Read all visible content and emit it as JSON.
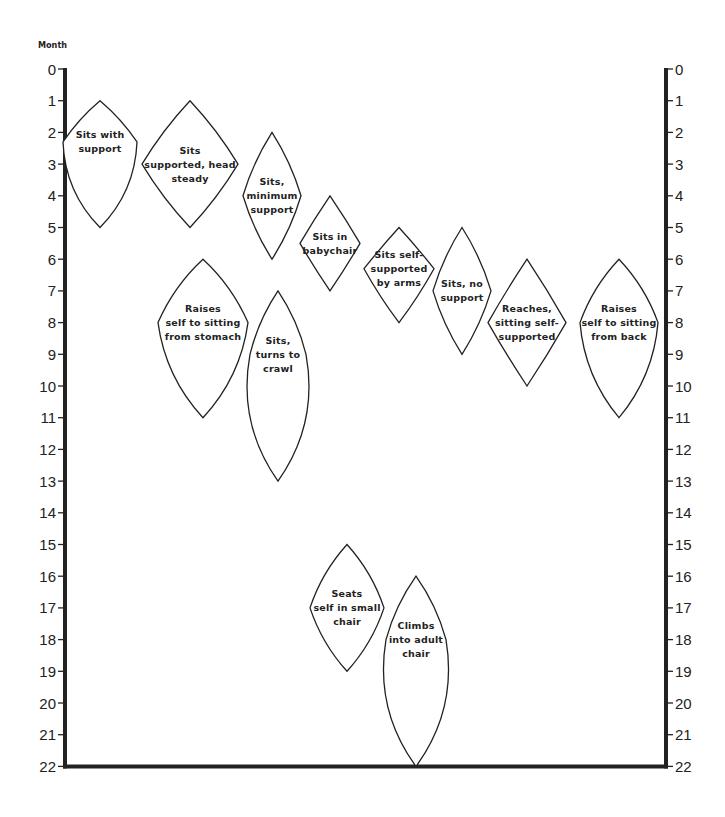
{
  "chart_data": {
    "type": "range-diamond",
    "title": "",
    "ylabel": "Month",
    "ylim": [
      0,
      22
    ],
    "yticks": [
      0,
      1,
      2,
      3,
      4,
      5,
      6,
      7,
      8,
      9,
      10,
      11,
      12,
      13,
      14,
      15,
      16,
      17,
      18,
      19,
      20,
      21,
      22
    ],
    "y_axis_both_sides": true,
    "grid": false,
    "items": [
      {
        "label": [
          "Sits with",
          "support"
        ],
        "start": 1,
        "peak": 2.3,
        "end": 5,
        "cx": 100,
        "hw": 37,
        "top_curve": 0.2,
        "bottom_curve": 0.55
      },
      {
        "label": [
          "Sits",
          "supported, head",
          "steady"
        ],
        "start": 1,
        "peak": 3,
        "end": 5,
        "cx": 190,
        "hw": 48,
        "top_curve": 0.15,
        "bottom_curve": 0.15
      },
      {
        "label": [
          "Sits,",
          "minimum",
          "support"
        ],
        "start": 2,
        "peak": 4,
        "end": 6,
        "cx": 272,
        "hw": 29,
        "top_curve": 0.2,
        "bottom_curve": 0.2
      },
      {
        "label": [
          "Sits in",
          "babychair"
        ],
        "start": 4,
        "peak": 5.5,
        "end": 7,
        "cx": 330,
        "hw": 30,
        "top_curve": 0.05,
        "bottom_curve": 0.05
      },
      {
        "label": [
          "Sits self-",
          "supported",
          "by arms"
        ],
        "start": 5,
        "peak": 6.3,
        "end": 8,
        "cx": 399,
        "hw": 35,
        "top_curve": 0.05,
        "bottom_curve": 0.1
      },
      {
        "label": [
          "Sits, no",
          "support"
        ],
        "start": 5,
        "peak": 7,
        "end": 9,
        "cx": 462,
        "hw": 29,
        "top_curve": 0.2,
        "bottom_curve": 0.2
      },
      {
        "label": [
          "Reaches,",
          "sitting self-",
          "supported"
        ],
        "start": 6,
        "peak": 8,
        "end": 10,
        "cx": 527,
        "hw": 39,
        "top_curve": 0.05,
        "bottom_curve": 0.05
      },
      {
        "label": [
          "Raises",
          "self to sitting",
          "from back"
        ],
        "start": 6,
        "peak": 8,
        "end": 11,
        "cx": 619,
        "hw": 39,
        "top_curve": 0.3,
        "bottom_curve": 0.45
      },
      {
        "label": [
          "Raises",
          "self to sitting",
          "from stomach"
        ],
        "start": 6,
        "peak": 8,
        "end": 11,
        "cx": 203,
        "hw": 45,
        "top_curve": 0.3,
        "bottom_curve": 0.45
      },
      {
        "label": [
          "Sits,",
          "turns to",
          "crawl"
        ],
        "start": 7,
        "peak": 9,
        "end": 13,
        "cx": 278,
        "hw": 28,
        "top_curve": 0.25,
        "bottom_curve": 0.6
      },
      {
        "label": [
          "Seats",
          "self in small",
          "chair"
        ],
        "start": 15,
        "peak": 17,
        "end": 19,
        "cx": 347,
        "hw": 37,
        "top_curve": 0.3,
        "bottom_curve": 0.3
      },
      {
        "label": [
          "Climbs",
          "into adult",
          "chair"
        ],
        "start": 16,
        "peak": 18,
        "end": 22,
        "cx": 416,
        "hw": 30,
        "top_curve": 0.25,
        "bottom_curve": 0.6
      }
    ]
  },
  "layout": {
    "left_axis_x": 65,
    "right_axis_x": 666,
    "y0": 69,
    "px_per_month": 31.7,
    "ink": "#222222"
  }
}
